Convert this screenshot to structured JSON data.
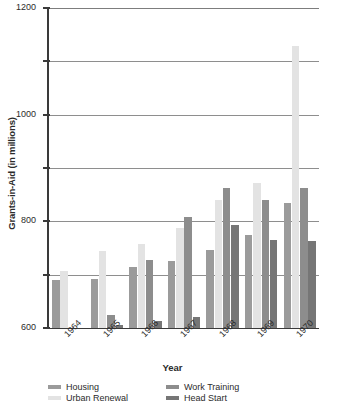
{
  "chart_data": {
    "type": "bar",
    "title": "",
    "xlabel": "Year",
    "ylabel": "Grants-in-Aid (in millions)",
    "categories": [
      "1964",
      "1965",
      "1966",
      "1967",
      "1968",
      "1969",
      "1970"
    ],
    "ylim": [
      0,
      1200
    ],
    "yticks": [
      0,
      200,
      400,
      600,
      800,
      1000,
      1200
    ],
    "ytick_labels": [
      "0",
      "200",
      "400",
      "600",
      "800",
      "1000",
      "1200"
    ],
    "grid": true,
    "legend_position": "bottom",
    "series": [
      {
        "name": "Housing",
        "color": "#9b9b9b",
        "values": [
          180,
          185,
          230,
          252,
          292,
          350,
          470
        ]
      },
      {
        "name": "Urban Renewal",
        "color": "#e3e3e3",
        "values": [
          212,
          288,
          315,
          375,
          480,
          545,
          1058
        ]
      },
      {
        "name": "Work Training",
        "color": "#8d8d8d",
        "values": [
          0,
          48,
          255,
          418,
          525,
          480,
          525
        ]
      },
      {
        "name": "Head Start",
        "color": "#767676",
        "values": [
          0,
          10,
          28,
          42,
          388,
          330,
          328
        ]
      }
    ]
  },
  "axis": {
    "y_title": "Grants-in-Aid (in millions)",
    "x_title": "Year"
  },
  "legend": {
    "items": [
      {
        "label": "Housing",
        "color": "#9b9b9b"
      },
      {
        "label": "Work Training",
        "color": "#8d8d8d"
      },
      {
        "label": "Urban Renewal",
        "color": "#e3e3e3"
      },
      {
        "label": "Head Start",
        "color": "#767676"
      }
    ]
  }
}
